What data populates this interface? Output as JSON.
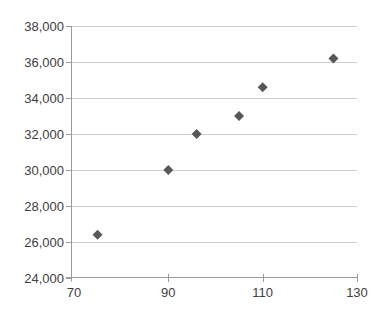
{
  "chart_data": {
    "type": "scatter",
    "title": "",
    "xlabel": "",
    "ylabel": "",
    "legend": "none",
    "grid": "horizontal",
    "marker": "diamond",
    "marker_size_px": 10,
    "x": [
      75,
      90,
      96,
      105,
      110,
      125
    ],
    "y": [
      26400,
      30000,
      32000,
      33000,
      34600,
      36200
    ],
    "points": [
      {
        "x": 75,
        "y": 26400
      },
      {
        "x": 90,
        "y": 30000
      },
      {
        "x": 96,
        "y": 32000
      },
      {
        "x": 105,
        "y": 33000
      },
      {
        "x": 110,
        "y": 34600
      },
      {
        "x": 125,
        "y": 36200
      }
    ],
    "xlim": [
      70,
      130
    ],
    "ylim": [
      24000,
      38000
    ],
    "xticks": [
      70,
      90,
      110,
      130
    ],
    "xtick_labels": [
      "70",
      "90",
      "110",
      "130"
    ],
    "yticks": [
      24000,
      26000,
      28000,
      30000,
      32000,
      34000,
      36000,
      38000
    ],
    "ytick_labels": [
      "24,000",
      "26,000",
      "28,000",
      "30,000",
      "32,000",
      "34,000",
      "36,000",
      "38,000"
    ],
    "colors": {
      "background": "#ffffff",
      "marker": "#58585a",
      "gridline": "#cfcfcf",
      "axis": "#9a9a9a",
      "tick_label": "#404040"
    }
  }
}
